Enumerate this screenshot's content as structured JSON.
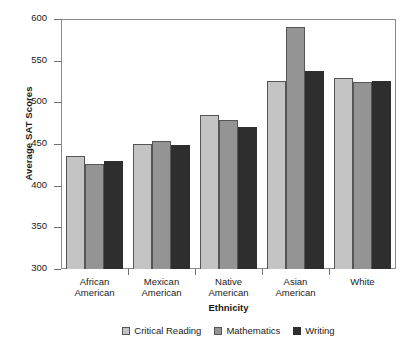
{
  "chart_data": {
    "type": "bar",
    "title": "",
    "xlabel": "Ethnicity",
    "ylabel": "Average SAT Scores",
    "ylim": [
      300,
      600
    ],
    "yticks": [
      300,
      350,
      400,
      450,
      500,
      550,
      600
    ],
    "grid": false,
    "legend_position": "bottom",
    "categories": [
      "African American",
      "Mexican American",
      "Native American",
      "Asian American",
      "White"
    ],
    "category_lines": [
      [
        "African",
        "American"
      ],
      [
        "Mexican",
        "American"
      ],
      [
        "Native",
        "American"
      ],
      [
        "Asian",
        "American"
      ],
      [
        "White",
        ""
      ]
    ],
    "series": [
      {
        "name": "Critical Reading",
        "color": "#c4c4c4",
        "values": [
          436,
          450,
          485,
          526,
          529
        ]
      },
      {
        "name": "Mathematics",
        "color": "#949494",
        "values": [
          426,
          454,
          479,
          591,
          524
        ]
      },
      {
        "name": "Writing",
        "color": "#2e2e2e",
        "values": [
          430,
          449,
          470,
          538,
          526
        ]
      }
    ]
  }
}
